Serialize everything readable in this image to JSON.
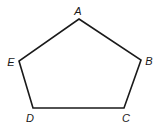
{
  "diagram": {
    "type": "pentagon",
    "stroke_color": "#1a1a1a",
    "fill_color": "#ffffff",
    "stroke_width": 1.6,
    "vertices": [
      {
        "label": "A",
        "x": 79,
        "y": 19,
        "label_x": 78,
        "label_y": 15
      },
      {
        "label": "B",
        "x": 141,
        "y": 60,
        "label_x": 149,
        "label_y": 65
      },
      {
        "label": "C",
        "x": 124,
        "y": 108,
        "label_x": 126,
        "label_y": 122
      },
      {
        "label": "D",
        "x": 33,
        "y": 108,
        "label_x": 30,
        "label_y": 122
      },
      {
        "label": "E",
        "x": 19,
        "y": 61,
        "label_x": 11,
        "label_y": 66
      }
    ]
  }
}
